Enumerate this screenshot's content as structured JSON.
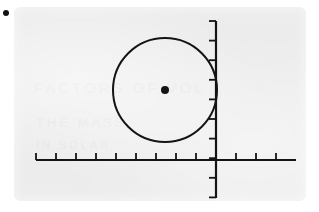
{
  "figure": {
    "bullet_marker": "bullet-dot",
    "ghost_text": {
      "line1": "FACTORS OF VOL",
      "line2": "THE MASS",
      "line3": "IN SOLAR"
    },
    "colors": {
      "paper": "#ececed",
      "ink": "#141414",
      "ghost": "#e3e3e5",
      "page": "#ffffff"
    }
  },
  "chart_data": {
    "type": "scatter",
    "title": "",
    "xlabel": "",
    "ylabel": "",
    "grid": false,
    "legend": null,
    "axes": {
      "x_axis": {
        "x_start_px": 36,
        "x_end_px": 296,
        "y_px": 160,
        "tick_direction": "up",
        "tick_length_px": 7,
        "tick_spacing_px": 20,
        "tick_count": 13,
        "tick_labels": []
      },
      "y_axis": {
        "x_px": 216,
        "y_start_px": 21,
        "y_end_px": 198,
        "tick_direction": "left",
        "tick_length_px": 7,
        "tick_spacing_px": 19.6,
        "tick_count": 10,
        "tick_labels": []
      }
    },
    "shapes": [
      {
        "kind": "circle",
        "center_x_px": 165,
        "center_y_px": 90,
        "radius_px": 52,
        "stroke": "#141414",
        "stroke_width_px": 2,
        "fill": "none",
        "note": "circle tangent to y-axis"
      },
      {
        "kind": "point",
        "label": "center-point",
        "x_px": 165,
        "y_px": 90,
        "radius_px": 4,
        "fill": "#141414"
      }
    ]
  }
}
